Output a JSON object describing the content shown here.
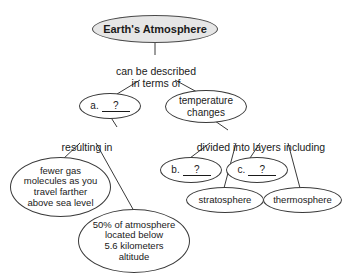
{
  "diagram": {
    "type": "concept-map",
    "title_node": {
      "label": "Earth's Atmosphere"
    },
    "nodes": [
      {
        "id": "root",
        "label": "Earth's Atmosphere"
      },
      {
        "id": "a-blank",
        "prefix": "a.",
        "blank": "?"
      },
      {
        "id": "temperature",
        "label": "temperature\nchanges"
      },
      {
        "id": "fewer-gas",
        "label": "fewer gas\nmolecules as you\ntravel farther\nabove sea level"
      },
      {
        "id": "fifty-percent",
        "label": "50% of atmosphere\nlocated below\n5.6 kilometers\naltitude"
      },
      {
        "id": "b-blank",
        "prefix": "b.",
        "blank": "?"
      },
      {
        "id": "c-blank",
        "prefix": "c.",
        "blank": "?"
      },
      {
        "id": "stratosphere",
        "label": "stratosphere"
      },
      {
        "id": "thermosphere",
        "label": "thermosphere"
      }
    ],
    "link_labels": [
      {
        "id": "can-be-described",
        "text": "can be described\nin terms of"
      },
      {
        "id": "resulting-in",
        "text": "resulting in"
      },
      {
        "id": "divided-into",
        "text": "divided into layers including"
      }
    ],
    "colors": {
      "stroke": "#3a3a3a",
      "text": "#1a1a1a",
      "root_fill": "#e6e6e6",
      "node_fill": "#ffffff",
      "background": "#ffffff"
    }
  }
}
